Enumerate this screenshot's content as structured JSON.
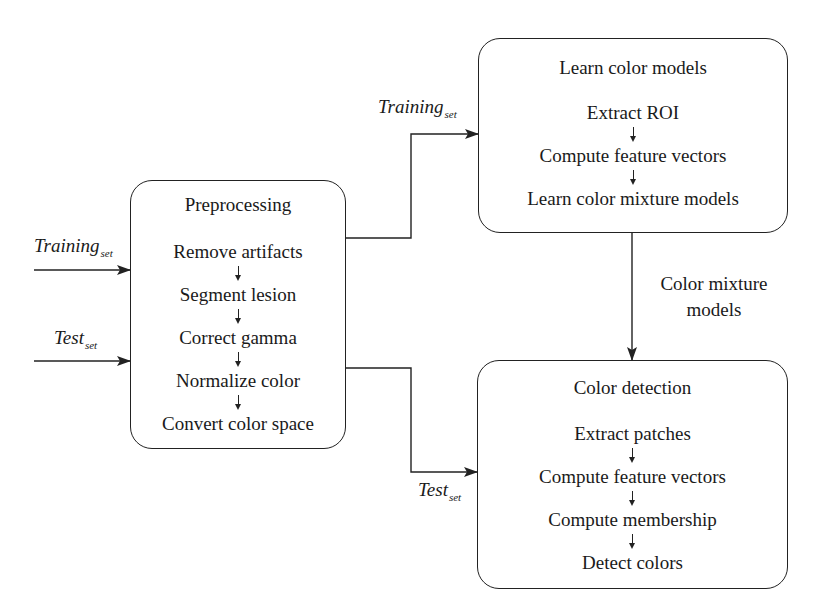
{
  "diagram": {
    "inputs": {
      "training": {
        "main": "Training",
        "sub": "set"
      },
      "test": {
        "main": "Test",
        "sub": "set"
      }
    },
    "preprocessing": {
      "title": "Preprocessing",
      "steps": [
        "Remove artifacts",
        "Segment lesion",
        "Correct gamma",
        "Normalize color",
        "Convert color space"
      ]
    },
    "learn": {
      "title": "Learn color models",
      "steps": [
        "Extract ROI",
        "Compute feature vectors",
        "Learn color mixture models"
      ]
    },
    "detection": {
      "title": "Color detection",
      "steps": [
        "Extract patches",
        "Compute feature vectors",
        "Compute membership",
        "Detect colors"
      ]
    },
    "edges": {
      "to_learn": {
        "main": "Training",
        "sub": "set"
      },
      "to_detection": {
        "main": "Test",
        "sub": "set"
      },
      "models_line1": "Color mixture",
      "models_line2": "models"
    },
    "colors": {
      "stroke": "#222222",
      "background": "#ffffff",
      "text": "#1a1a1a"
    }
  }
}
